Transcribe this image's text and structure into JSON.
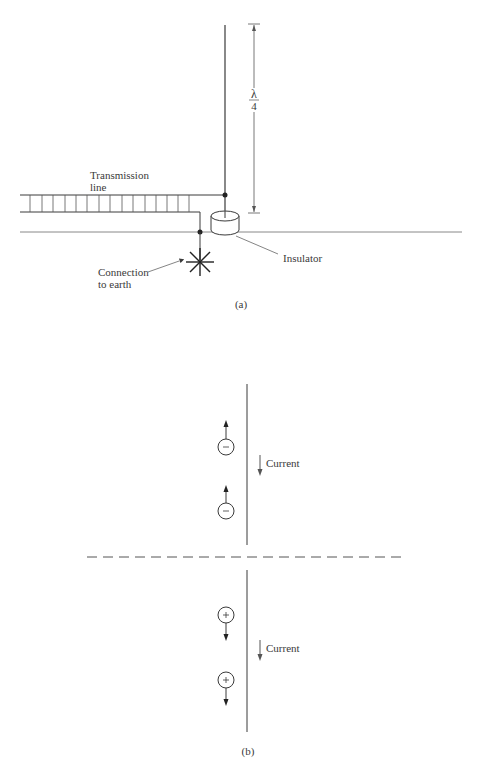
{
  "figure_a": {
    "caption": "(a)",
    "labels": {
      "transmission_line_1": "Transmission",
      "transmission_line_2": "line",
      "insulator": "Insulator",
      "connection_1": "Connection",
      "connection_2": "to earth",
      "lambda": "λ",
      "four": "4"
    }
  },
  "figure_b": {
    "caption": "(b)",
    "current_label_top": "Current",
    "current_label_bottom": "Current",
    "charges_top": [
      "−",
      "−"
    ],
    "charges_bottom": [
      "+",
      "+"
    ]
  },
  "colors": {
    "line": "#3a3a3a",
    "text": "#3a3a3a"
  }
}
